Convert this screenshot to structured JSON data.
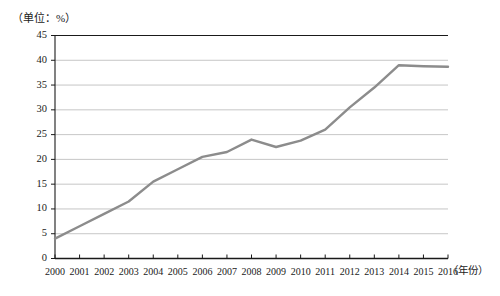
{
  "chart_data": {
    "type": "line",
    "title": "（单位：%）",
    "xlabel": "（年份）",
    "ylabel": "",
    "categories": [
      "2000",
      "2001",
      "2002",
      "2003",
      "2004",
      "2005",
      "2006",
      "2007",
      "2008",
      "2009",
      "2010",
      "2011",
      "2012",
      "2013",
      "2014",
      "2015",
      "2016"
    ],
    "values": [
      4.0,
      6.5,
      9.0,
      11.5,
      15.5,
      18.0,
      20.5,
      21.5,
      24.0,
      22.5,
      23.8,
      26.0,
      30.5,
      34.5,
      39.0,
      38.8,
      38.7
    ],
    "ylim": [
      0,
      45
    ],
    "yticks": [
      0,
      5,
      10,
      15,
      20,
      25,
      30,
      35,
      40,
      45
    ],
    "ytick_labels": [
      "0",
      "5",
      "10",
      "15",
      "20",
      "25",
      "30",
      "35",
      "40",
      "45"
    ],
    "grid": true,
    "legend": "none",
    "series_color": "#8c8c8c",
    "axis_color": "#1a1a1a",
    "grid_color": "#bfbfbf"
  },
  "axes": {
    "unit_title": "（单位：%）",
    "x_axis_title": "（年份）"
  }
}
